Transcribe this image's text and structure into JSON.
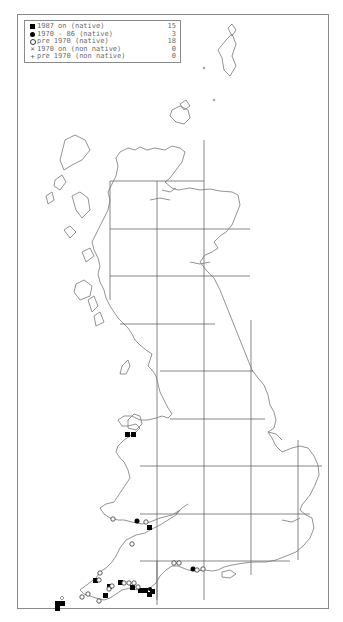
{
  "legend": {
    "items": [
      {
        "symbol": "filled-square",
        "label": "1987 on (native)",
        "count": "15"
      },
      {
        "symbol": "filled-circle",
        "label": "1970 - 86 (native)",
        "count": "3"
      },
      {
        "symbol": "open-circle",
        "label": "pre 1970 (native)",
        "count": "18"
      },
      {
        "symbol": "cross",
        "label": "1970 on (non native)",
        "count": "0"
      },
      {
        "symbol": "plus",
        "label": "pre 1970 (non native)",
        "count": "0"
      }
    ]
  },
  "map": {
    "region": "Great Britain",
    "grid": {
      "vertical_lines_x": [
        110,
        157,
        204,
        251,
        298
      ],
      "horizontal_lines_y": [
        181,
        229,
        276,
        324,
        371,
        419,
        466,
        514,
        561
      ]
    },
    "colors": {
      "coastline": "#777777",
      "grid": "#555555",
      "symbol": "#000000"
    },
    "records": {
      "filled_square": [
        [
          128,
          435
        ],
        [
          134,
          435
        ],
        [
          170,
          530
        ],
        [
          92,
          580
        ],
        [
          102,
          596
        ],
        [
          107,
          587
        ],
        [
          120,
          583
        ],
        [
          132,
          587
        ],
        [
          140,
          591
        ],
        [
          145,
          591
        ],
        [
          148,
          595
        ],
        [
          153,
          592
        ],
        [
          57,
          604
        ],
        [
          57,
          610
        ],
        [
          63,
          604
        ]
      ],
      "filled_circle": [
        [
          136,
          520
        ],
        [
          190,
          569
        ],
        [
          150,
          588
        ]
      ],
      "open_circle": [
        [
          113,
          520
        ],
        [
          146,
          522
        ],
        [
          132,
          544
        ],
        [
          101,
          573
        ],
        [
          100,
          580
        ],
        [
          88,
          594
        ],
        [
          95,
          597
        ],
        [
          100,
          600
        ],
        [
          108,
          584
        ],
        [
          112,
          581
        ],
        [
          123,
          583
        ],
        [
          128,
          583
        ],
        [
          133,
          583
        ],
        [
          137,
          588
        ],
        [
          174,
          563
        ],
        [
          179,
          563
        ],
        [
          195,
          569
        ],
        [
          204,
          569
        ]
      ]
    }
  }
}
